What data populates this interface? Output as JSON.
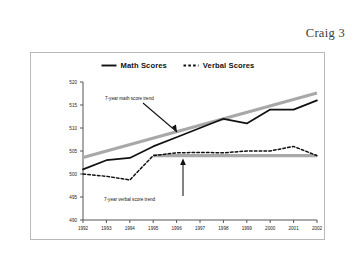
{
  "header": {
    "running_head": "Craig 3"
  },
  "chart_data": {
    "type": "line",
    "title": "",
    "xlabel": "",
    "ylabel": "",
    "categories": [
      "1992",
      "1993",
      "1994",
      "1995",
      "1996",
      "1997",
      "1998",
      "1999",
      "2000",
      "2001",
      "2002"
    ],
    "x": [
      1992,
      1993,
      1994,
      1995,
      1996,
      1997,
      1998,
      1999,
      2000,
      2001,
      2002
    ],
    "ylim": [
      490,
      520
    ],
    "yticks": [
      490,
      495,
      500,
      505,
      510,
      515,
      520
    ],
    "ytick_labels": [
      "490",
      "495",
      "500",
      "505",
      "510",
      "515",
      "520"
    ],
    "xtick_labels": [
      "1992",
      "1993",
      "1994",
      "1995",
      "1996",
      "1997",
      "1998",
      "1999",
      "2000",
      "2001",
      "2002"
    ],
    "grid": false,
    "legend_position": "top-center",
    "series": [
      {
        "name": "Math Scores",
        "style": "solid",
        "color": "#111111",
        "values": [
          501,
          503,
          503.5,
          506,
          508,
          510,
          512,
          511,
          514,
          514,
          516
        ]
      },
      {
        "name": "Verbal Scores",
        "style": "dashed",
        "color": "#111111",
        "values": [
          500,
          499.5,
          498.7,
          504,
          504.6,
          504.7,
          504.6,
          505,
          505,
          506,
          504
        ]
      }
    ],
    "trend_lines": [
      {
        "name": "7-year math score trend",
        "color": "#a8a8a8",
        "from": {
          "x": 1992,
          "y": 503.6
        },
        "to": {
          "x": 2002,
          "y": 517.6
        }
      },
      {
        "name": "7-year verbal score trend",
        "color": "#a8a8a8",
        "from": {
          "x": 1995,
          "y": 504
        },
        "to": {
          "x": 2002,
          "y": 504
        }
      }
    ],
    "annotations": [
      {
        "label": "7-year math score trend",
        "target": "math-trend-line",
        "arrow": "diagonal-down-right"
      },
      {
        "label": "7-year verbal score trend",
        "target": "verbal-trend-line",
        "arrow": "vertical-up"
      }
    ]
  },
  "legend": {
    "entries": [
      {
        "label": "Math Scores",
        "style": "solid"
      },
      {
        "label": "Verbal Scores",
        "style": "dashed"
      }
    ]
  },
  "colors": {
    "series": "#111111",
    "trend": "#a8a8a8",
    "axis": "#555555",
    "frame": "#b9b9b9"
  }
}
